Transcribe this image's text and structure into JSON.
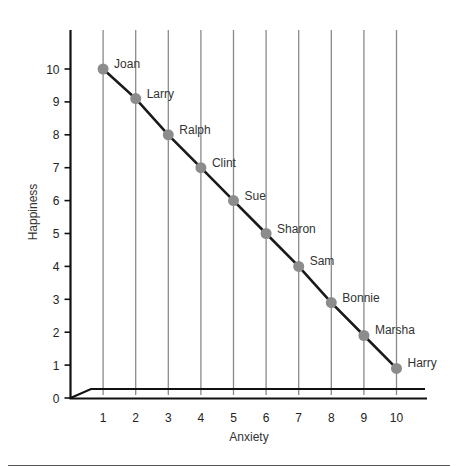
{
  "chart_data": {
    "type": "line",
    "title": "",
    "xlabel": "Anxiety",
    "ylabel": "Happiness",
    "x_ticks": [
      "1",
      "2",
      "3",
      "4",
      "5",
      "6",
      "7",
      "8",
      "9",
      "10"
    ],
    "y_ticks": [
      "0",
      "1",
      "2",
      "3",
      "4",
      "5",
      "6",
      "7",
      "8",
      "9",
      "10"
    ],
    "xlim": [
      0,
      10
    ],
    "ylim": [
      0,
      11
    ],
    "grid": "vertical lines at each x tick",
    "legend": null,
    "series": [
      {
        "name": "people",
        "marker": "circle",
        "line_color": "#1a1a1a",
        "marker_color": "#8c8c8c",
        "points": [
          {
            "label": "Joan",
            "x": 1,
            "y": 10
          },
          {
            "label": "Larry",
            "x": 2,
            "y": 9.1
          },
          {
            "label": "Ralph",
            "x": 3,
            "y": 8
          },
          {
            "label": "Clint",
            "x": 4,
            "y": 7
          },
          {
            "label": "Sue",
            "x": 5,
            "y": 6
          },
          {
            "label": "Sharon",
            "x": 6,
            "y": 5
          },
          {
            "label": "Sam",
            "x": 7,
            "y": 4
          },
          {
            "label": "Bonnie",
            "x": 8,
            "y": 2.9
          },
          {
            "label": "Marsha",
            "x": 9,
            "y": 1.9
          },
          {
            "label": "Harry",
            "x": 10,
            "y": 0.9
          }
        ]
      }
    ]
  },
  "colors": {
    "axis": "#111111",
    "gridline": "#8a8a8a",
    "marker": "#8c8c8c",
    "line": "#1a1a1a",
    "footer_rule": "#555555"
  }
}
